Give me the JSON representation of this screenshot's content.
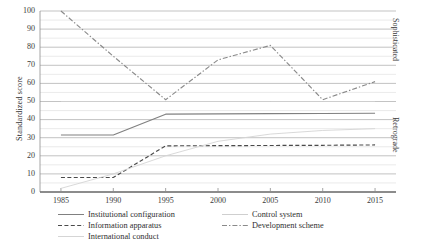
{
  "axes": {
    "ylabel": "Standardized score",
    "xlabel": "",
    "y_ticks": [
      "0",
      "10",
      "20",
      "30",
      "40",
      "50",
      "60",
      "70",
      "80",
      "90",
      "100"
    ],
    "x_ticks": [
      "1985",
      "1990",
      "1995",
      "2000",
      "2005",
      "2010",
      "2015"
    ]
  },
  "side_labels": {
    "upper": "Sophisticated",
    "lower": "Retrograde"
  },
  "legend": {
    "items": [
      {
        "label": "Institutional configuration",
        "style": "solid",
        "color": "#808080"
      },
      {
        "label": "Information apparatus",
        "style": "dashed",
        "color": "#4a4a4a"
      },
      {
        "label": "International conduct",
        "style": "solid",
        "color": "#d5d5d5"
      },
      {
        "label": "Control system",
        "style": "solid",
        "color": "#cfcfcf"
      },
      {
        "label": "Development scheme",
        "style": "dashdot",
        "color": "#8a8a8a"
      }
    ]
  },
  "chart_data": {
    "type": "line",
    "title": "",
    "xlabel": "",
    "ylabel": "Standardized score",
    "x": [
      1985,
      1990,
      1995,
      2000,
      2005,
      2010,
      2015
    ],
    "xlim": [
      1983,
      2017
    ],
    "ylim": [
      0,
      100
    ],
    "ytick_step": 10,
    "grid": true,
    "minor_grid": true,
    "legend_position": "bottom",
    "series": [
      {
        "name": "Institutional configuration",
        "style": "solid",
        "color": "#808080",
        "values": [
          31.5,
          31.5,
          43.0,
          43.2,
          43.3,
          43.4,
          43.5
        ]
      },
      {
        "name": "Information apparatus",
        "style": "dashed",
        "color": "#4a4a4a",
        "values": [
          8.0,
          8.0,
          25.5,
          25.6,
          25.7,
          25.8,
          26.0
        ]
      },
      {
        "name": "International conduct",
        "style": "solid",
        "color": "#d5d5d5",
        "values": [
          2.0,
          10.0,
          20.0,
          28.0,
          32.0,
          34.0,
          35.0
        ]
      },
      {
        "name": "Control system",
        "style": "solid",
        "color": "#cfcfcf",
        "values": [
          50.0,
          50.0,
          50.0,
          50.0,
          50.0,
          50.0,
          50.0
        ]
      },
      {
        "name": "Development scheme",
        "style": "dashdot",
        "color": "#8a8a8a",
        "values": [
          100.0,
          75.0,
          51.0,
          73.0,
          81.0,
          51.0,
          61.0
        ]
      }
    ]
  }
}
